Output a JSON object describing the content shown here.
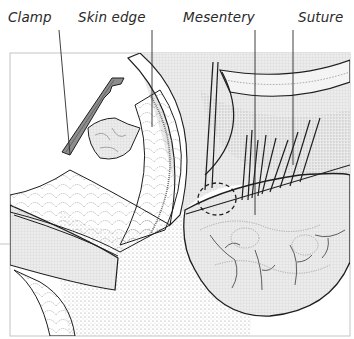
{
  "figure": {
    "type": "surgical-illustration",
    "labels": [
      {
        "id": "clamp",
        "text": "Clamp",
        "x": 8
      },
      {
        "id": "skin-edge",
        "text": "Skin edge",
        "x": 78
      },
      {
        "id": "mesentery",
        "text": "Mesentery",
        "x": 183
      },
      {
        "id": "suture",
        "text": "Suture",
        "x": 298
      }
    ],
    "colors": {
      "line": "#1e1e1e",
      "frame": "#bdbdbd",
      "clamp_fill": "#8a8a8a",
      "tissue_fill": "#e6e6e6",
      "stipple": "#9a9a9a",
      "background": "#ffffff"
    }
  }
}
